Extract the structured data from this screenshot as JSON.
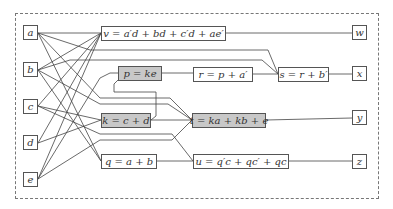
{
  "diagram": {
    "inputs": [
      {
        "id": "a",
        "label": "a"
      },
      {
        "id": "b",
        "label": "b"
      },
      {
        "id": "c",
        "label": "c"
      },
      {
        "id": "d",
        "label": "d"
      },
      {
        "id": "e",
        "label": "e"
      }
    ],
    "gates": {
      "v": {
        "label": "v = a′d + bd + c′d + ae′",
        "highlighted": false
      },
      "p": {
        "label": "p = ke",
        "highlighted": true
      },
      "r": {
        "label": "r = p + a′",
        "highlighted": false
      },
      "s": {
        "label": "s = r + b′",
        "highlighted": false
      },
      "k": {
        "label": "k = c + d",
        "highlighted": true
      },
      "t": {
        "label": "t = ka + kb + e",
        "highlighted": true
      },
      "q": {
        "label": "q = a + b",
        "highlighted": false
      },
      "u": {
        "label": "u = q′c + qc′ + qc",
        "highlighted": false
      }
    },
    "outputs": [
      {
        "id": "w",
        "label": "w"
      },
      {
        "id": "x",
        "label": "x"
      },
      {
        "id": "y",
        "label": "y"
      },
      {
        "id": "z",
        "label": "z"
      }
    ],
    "edges": [
      [
        "a",
        "v"
      ],
      [
        "b",
        "v"
      ],
      [
        "c",
        "v"
      ],
      [
        "d",
        "v"
      ],
      [
        "e",
        "v"
      ],
      [
        "a",
        "s"
      ],
      [
        "b",
        "s"
      ],
      [
        "e",
        "p"
      ],
      [
        "k",
        "p"
      ],
      [
        "p",
        "r"
      ],
      [
        "a",
        "r"
      ],
      [
        "r",
        "s"
      ],
      [
        "c",
        "k"
      ],
      [
        "d",
        "k"
      ],
      [
        "a",
        "t"
      ],
      [
        "b",
        "t"
      ],
      [
        "k",
        "t"
      ],
      [
        "e",
        "t"
      ],
      [
        "a",
        "q"
      ],
      [
        "b",
        "q"
      ],
      [
        "q",
        "u"
      ],
      [
        "c",
        "u"
      ],
      [
        "v",
        "w"
      ],
      [
        "s",
        "x"
      ],
      [
        "t",
        "y"
      ],
      [
        "u",
        "z"
      ]
    ],
    "colors": {
      "highlight_fill": "#c8c8c8",
      "line": "#444444",
      "border": "#555555"
    }
  }
}
